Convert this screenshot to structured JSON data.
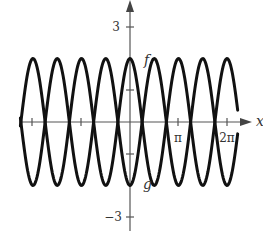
{
  "chart_data": {
    "type": "line",
    "title": "",
    "xlabel": "x",
    "ylabel": "",
    "xlim": [
      -7.07,
      6.91
    ],
    "ylim": [
      -3,
      3
    ],
    "grid": false,
    "legend": "none (curves labeled inline)",
    "x_ticks": [
      {
        "value": -6.2832,
        "label": ""
      },
      {
        "value": -3.1416,
        "label": ""
      },
      {
        "value": 3.1416,
        "label": "π"
      },
      {
        "value": 6.2832,
        "label": "2π"
      }
    ],
    "y_ticks": [
      {
        "value": 3,
        "label": "3"
      },
      {
        "value": 1,
        "label": ""
      },
      {
        "value": -1,
        "label": ""
      },
      {
        "value": -3,
        "label": "−3"
      }
    ],
    "series": [
      {
        "name": "f",
        "formula": "f(x) = 2cos(2x)",
        "amplitude": 2,
        "period": 3.1416,
        "label_position": "at (0, 2), right of y-axis",
        "key_points": [
          {
            "x": -6.2832,
            "y": 2
          },
          {
            "x": -4.7124,
            "y": -2
          },
          {
            "x": -3.1416,
            "y": 2
          },
          {
            "x": -1.5708,
            "y": -2
          },
          {
            "x": 0,
            "y": 2
          },
          {
            "x": 1.5708,
            "y": -2
          },
          {
            "x": 3.1416,
            "y": 2
          },
          {
            "x": 4.7124,
            "y": -2
          },
          {
            "x": 6.2832,
            "y": 2
          }
        ]
      },
      {
        "name": "g",
        "formula": "g(x) = -2cos(2x)",
        "amplitude": 2,
        "period": 3.1416,
        "label_position": "at (0, -2), right of y-axis",
        "key_points": [
          {
            "x": -6.2832,
            "y": -2
          },
          {
            "x": -4.7124,
            "y": 2
          },
          {
            "x": -3.1416,
            "y": -2
          },
          {
            "x": -1.5708,
            "y": 2
          },
          {
            "x": 0,
            "y": -2
          },
          {
            "x": 1.5708,
            "y": 2
          },
          {
            "x": 3.1416,
            "y": -2
          },
          {
            "x": 4.7124,
            "y": 2
          },
          {
            "x": 6.2832,
            "y": -2
          }
        ]
      }
    ],
    "intersections_x": [
      -5.4978,
      -3.927,
      -2.3562,
      -0.7854,
      0.7854,
      2.3562,
      3.927,
      5.4978
    ]
  },
  "labels": {
    "x_axis": "x",
    "y_tick_top": "3",
    "y_tick_bottom": "−3",
    "x_tick_pi": "π",
    "x_tick_2pi": "2π",
    "curve_f": "f",
    "curve_g": "g"
  },
  "style": {
    "axis_color": "#555555",
    "curve_color": "#111111",
    "label_color": "#333333"
  }
}
